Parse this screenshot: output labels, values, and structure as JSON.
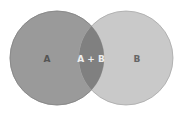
{
  "diagram": {
    "type": "venn",
    "sets": [
      {
        "label": "A",
        "color": "#9a9a9a",
        "stroke": "#8a8a8a"
      },
      {
        "label": "B",
        "color": "#c8c8c8",
        "stroke": "#a8a8a8"
      }
    ],
    "intersection": {
      "label": "A + B",
      "color": "#7e7e7e"
    }
  }
}
